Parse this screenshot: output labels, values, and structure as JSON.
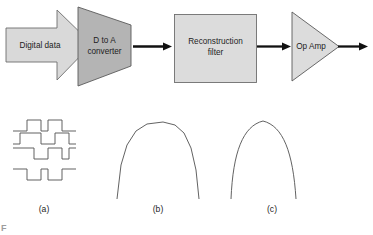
{
  "figure": {
    "background_color": "#ffffff",
    "line_color": "#3a3a3a",
    "arrow_color": "#111111",
    "wave_color": "#5a5a5a"
  },
  "blocks": {
    "digital_data": {
      "label_line1": "Digital data",
      "shape": "block-arrow-right",
      "fill": "#d9d9d9",
      "stroke": "#6e6e6e"
    },
    "dac": {
      "label_line1": "D to A",
      "label_line2": "converter",
      "shape": "trapezoid",
      "fill": "#b4b4b4",
      "stroke": "#5a5a5a"
    },
    "reconstruction_filter": {
      "label_line1": "Reconstruction",
      "label_line2": "filter",
      "shape": "rectangle",
      "fill": "#dcdcdc",
      "stroke": "#6e6e6e"
    },
    "op_amp": {
      "label_line1": "Op Amp",
      "shape": "triangle-right",
      "fill": "#dcdcdc",
      "stroke": "#5a5a5a"
    }
  },
  "connectors": {
    "dac_to_filter": "arrow-right",
    "filter_to_opamp": "arrow-right",
    "opamp_to_output": "arrow-right"
  },
  "waveforms": {
    "a": {
      "caption": "(a)",
      "description": "four digital square-wave traces",
      "trace_count": 4
    },
    "b": {
      "caption": "(b)",
      "description": "piecewise-linear stepped reconstructed arch"
    },
    "c": {
      "caption": "(c)",
      "description": "smooth filtered analog arch"
    }
  },
  "artifact": {
    "text": "F"
  }
}
